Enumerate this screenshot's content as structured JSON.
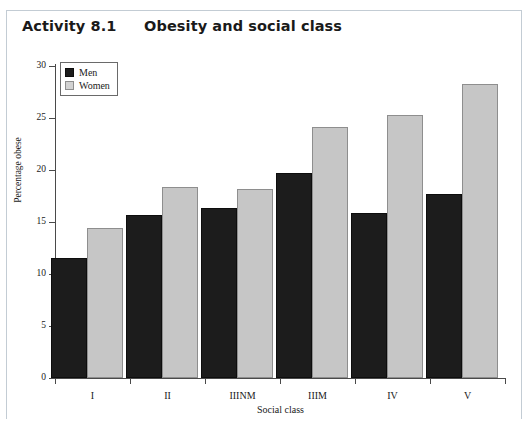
{
  "header": {
    "activity_label": "Activity 8.1",
    "title": "Obesity and social class"
  },
  "chart_data": {
    "type": "bar",
    "title": "Obesity and social class",
    "xlabel": "Social class",
    "ylabel": "Percentage obese",
    "categories": [
      "I",
      "II",
      "IIINM",
      "IIIM",
      "IV",
      "V"
    ],
    "series": [
      {
        "name": "Men",
        "values": [
          11.5,
          15.7,
          16.3,
          19.7,
          15.9,
          17.7
        ],
        "color": "#1c1c1c"
      },
      {
        "name": "Women",
        "values": [
          14.4,
          18.4,
          18.2,
          24.1,
          25.3,
          28.3
        ],
        "color": "#c6c6c6"
      }
    ],
    "ylim": [
      0,
      30
    ],
    "yticks": [
      0,
      5,
      10,
      15,
      20,
      25,
      30
    ],
    "grid": false,
    "legend_position": "top-left"
  }
}
